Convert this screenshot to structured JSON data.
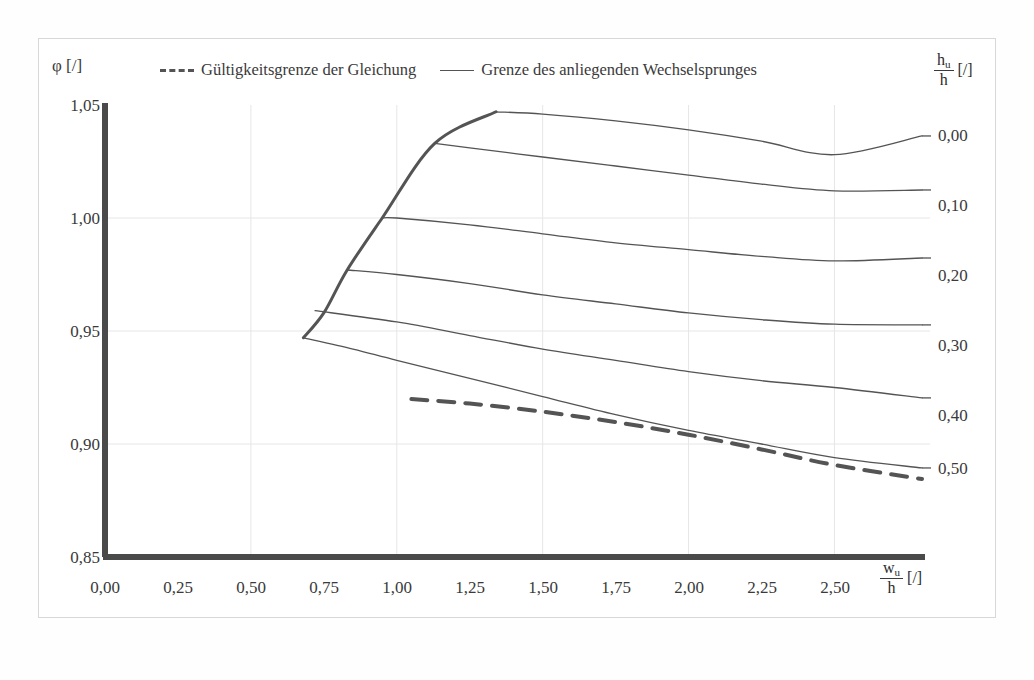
{
  "figure": {
    "background_color": "#ffffff",
    "frame_color": "#d8d8d8",
    "axis_color": "#4a4a4a",
    "curve_color": "#545454",
    "grid_color": "#e6e6e6"
  },
  "legend": {
    "entries": [
      {
        "label": "Gültigkeitsgrenze der Gleichung",
        "style": "dashed"
      },
      {
        "label": "Grenze des anliegenden Wechselsprunges",
        "style": "solid"
      }
    ]
  },
  "axes": {
    "y": {
      "symbol": "φ",
      "unit": "[/]",
      "title": "φ [/]",
      "ticks": [
        "0,85",
        "0,90",
        "0,95",
        "1,00",
        "1,05"
      ],
      "values": [
        0.85,
        0.9,
        0.95,
        1.0,
        1.05
      ],
      "min": 0.85,
      "max": 1.05
    },
    "x": {
      "numerator": "w",
      "numerator_sub": "u",
      "denominator": "h",
      "unit": "[/]",
      "title": "w_u/h [/]",
      "ticks": [
        "0,00",
        "0,25",
        "0,50",
        "0,75",
        "1,00",
        "1,25",
        "1,50",
        "1,75",
        "2,00",
        "2,25",
        "2,50"
      ],
      "values": [
        0.0,
        0.25,
        0.5,
        0.75,
        1.0,
        1.25,
        1.5,
        1.75,
        2.0,
        2.25,
        2.5
      ],
      "min": 0.0,
      "max": 2.8
    },
    "right": {
      "numerator": "h",
      "numerator_sub": "u",
      "denominator": "h",
      "unit": "[/]",
      "title": "h_u/h [/]",
      "labels": [
        "0,00",
        "0,10",
        "0,20",
        "0,30",
        "0,40",
        "0,50"
      ]
    }
  },
  "chart_data": {
    "type": "line",
    "title": "",
    "xlabel": "w_u/h [/]",
    "ylabel": "φ [/]",
    "xlim": [
      0.0,
      2.8
    ],
    "ylim": [
      0.85,
      1.05
    ],
    "grid": true,
    "legend_position": "top",
    "series": [
      {
        "name": "0,00",
        "label": "0,00",
        "style": "solid",
        "x": [
          1.34,
          1.5,
          1.75,
          2.0,
          2.25,
          2.5,
          2.8
        ],
        "y": [
          1.047,
          1.046,
          1.043,
          1.039,
          1.034,
          1.028,
          1.0363
        ]
      },
      {
        "name": "0,10",
        "label": "0,10",
        "style": "solid",
        "x": [
          1.13,
          1.25,
          1.5,
          1.75,
          2.0,
          2.25,
          2.5,
          2.8
        ],
        "y": [
          1.033,
          1.031,
          1.027,
          1.023,
          1.019,
          1.015,
          1.012,
          1.0124
        ]
      },
      {
        "name": "0,20",
        "label": "0,20",
        "style": "solid",
        "x": [
          0.95,
          1.0,
          1.25,
          1.5,
          1.75,
          2.0,
          2.25,
          2.5,
          2.8
        ],
        "y": [
          1.0,
          1.0,
          0.997,
          0.993,
          0.989,
          0.986,
          0.983,
          0.981,
          0.9823
        ]
      },
      {
        "name": "0,30",
        "label": "0,30",
        "style": "solid",
        "x": [
          0.83,
          1.0,
          1.25,
          1.5,
          1.75,
          2.0,
          2.25,
          2.5,
          2.8
        ],
        "y": [
          0.977,
          0.975,
          0.971,
          0.966,
          0.962,
          0.958,
          0.955,
          0.953,
          0.9527
        ]
      },
      {
        "name": "0,40",
        "label": "0,40",
        "style": "solid",
        "x": [
          0.72,
          1.0,
          1.25,
          1.5,
          1.75,
          2.0,
          2.25,
          2.5,
          2.8
        ],
        "y": [
          0.959,
          0.954,
          0.948,
          0.942,
          0.937,
          0.932,
          0.928,
          0.925,
          0.9204
        ]
      },
      {
        "name": "0,50",
        "label": "0,50",
        "style": "solid",
        "x": [
          0.68,
          0.85,
          1.0,
          1.25,
          1.5,
          1.75,
          2.0,
          2.25,
          2.5,
          2.8
        ],
        "y": [
          0.947,
          0.942,
          0.937,
          0.929,
          0.921,
          0.913,
          0.906,
          0.9,
          0.894,
          0.8894
        ]
      },
      {
        "name": "Grenze des anliegenden Wechselsprunges",
        "label": "envelope",
        "style": "solid-bold",
        "x": [
          0.68,
          0.75,
          0.83,
          0.95,
          1.13,
          1.34
        ],
        "y": [
          0.947,
          0.958,
          0.977,
          1.0,
          1.033,
          1.047
        ]
      },
      {
        "name": "Gültigkeitsgrenze der Gleichung",
        "label": "validity-limit",
        "style": "dashed",
        "x": [
          1.05,
          1.25,
          1.5,
          1.75,
          2.0,
          2.25,
          2.5,
          2.8
        ],
        "y": [
          0.9199,
          0.9179,
          0.9143,
          0.9097,
          0.9041,
          0.8976,
          0.8907,
          0.8845
        ]
      }
    ]
  }
}
